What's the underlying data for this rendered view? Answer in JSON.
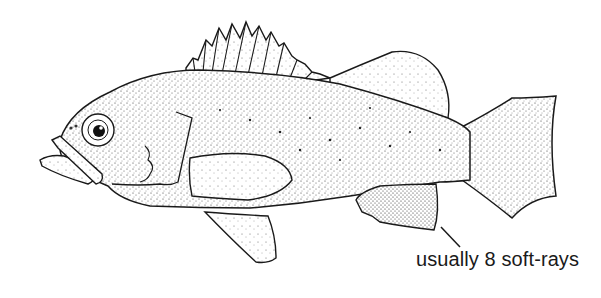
{
  "figure": {
    "style": "stipple line drawing",
    "colors": {
      "ink": "#1a1a1a",
      "background": "#ffffff"
    }
  },
  "annotation": {
    "text": "usually 8 soft-rays",
    "target": "anal-fin"
  }
}
